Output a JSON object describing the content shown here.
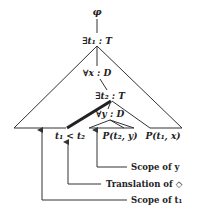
{
  "diagram": {
    "nodes": {
      "root": "φ",
      "exists_t1": "∃t₁ : T",
      "forall_x": "∀x : D",
      "exists_t2": "∃t₂ : T",
      "forall_y": "∀y : D"
    },
    "leaves": {
      "less_than": "t₁ < t₂",
      "p_t2_y": "P(t₂, y)",
      "p_t1_x": "P(t₁, x)"
    },
    "annotations": {
      "scope_y": "Scope of y",
      "translation_diamond": "Translation of ◇",
      "scope_t1": "Scope of t₁"
    },
    "colors": {
      "line": "#333333",
      "text": "#222222",
      "background": "#ffffff"
    }
  }
}
